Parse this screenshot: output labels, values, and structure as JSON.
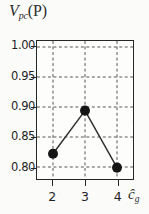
{
  "chart_data": {
    "type": "line",
    "title": "",
    "ylabel": "Vpc(P)",
    "ylabel_parts": {
      "main": "V",
      "sub": "pc",
      "arg": "(P)"
    },
    "xlabel": "ĉg",
    "xlabel_parts": {
      "main": "ĉ",
      "sub": "g"
    },
    "x": [
      2,
      3,
      4
    ],
    "values": [
      0.822,
      0.894,
      0.799
    ],
    "series": [
      {
        "name": "Vpc(P)",
        "values": [
          0.822,
          0.894,
          0.799
        ]
      }
    ],
    "xticklabels": [
      "2",
      "3",
      "4"
    ],
    "yticklabels": [
      "1.00",
      "0.95",
      "0.90",
      "0.85",
      "0.80"
    ],
    "ytickvalues": [
      1.0,
      0.95,
      0.9,
      0.85,
      0.8
    ],
    "xlim": [
      1.5,
      4.5
    ],
    "ylim": [
      0.78,
      1.01
    ],
    "grid": true,
    "grid_style": "dashed",
    "legend": "none",
    "marker": "filled-circle",
    "line_color": "#303030",
    "marker_color": "#151515",
    "grid_color": "#555555",
    "frame_color": "#262626",
    "background": "#fdfdfc"
  }
}
